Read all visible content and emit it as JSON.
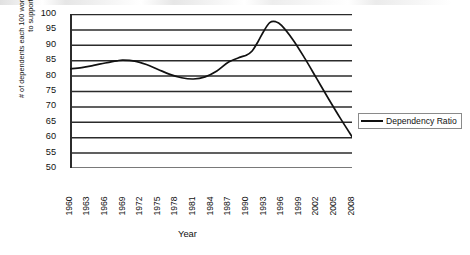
{
  "chart_data": {
    "type": "line",
    "title": "",
    "xlabel": "Year",
    "ylabel": "# of dependents each 100 working age adults have to support",
    "ylim": [
      50,
      100
    ],
    "xlim": [
      1960,
      2008
    ],
    "grid": true,
    "legend_position": "right",
    "y_ticks": [
      100,
      95,
      90,
      85,
      80,
      75,
      70,
      65,
      60,
      55,
      50
    ],
    "x_ticks": [
      1960,
      1963,
      1966,
      1969,
      1972,
      1975,
      1978,
      1981,
      1984,
      1987,
      1990,
      1993,
      1996,
      1999,
      2002,
      2005,
      2008
    ],
    "series": [
      {
        "name": "Dependency Ratio",
        "color": "#111111",
        "x": [
          1960,
          1962,
          1964,
          1966,
          1968,
          1969,
          1971,
          1973,
          1975,
          1977,
          1979,
          1981,
          1983,
          1985,
          1987,
          1989,
          1990,
          1991,
          1992,
          1993,
          1994,
          1995,
          1996,
          1998,
          2000,
          2002,
          2004,
          2006,
          2008
        ],
        "values": [
          82.2,
          82.6,
          83.3,
          84.1,
          84.8,
          85.0,
          84.7,
          83.6,
          82.0,
          80.4,
          79.3,
          78.9,
          79.6,
          81.5,
          84.4,
          86.0,
          86.6,
          88.0,
          91.0,
          94.5,
          97.2,
          97.5,
          96.3,
          91.5,
          85.5,
          79.0,
          72.5,
          66.2,
          60.2
        ]
      }
    ],
    "legend": [
      "Dependency Ratio"
    ]
  },
  "axes": {
    "y_title": "# of dependents each 100 working age adults have to support",
    "x_title": "Year"
  },
  "legend": {
    "items": [
      {
        "label": "Dependency Ratio",
        "color": "#111111"
      }
    ]
  }
}
